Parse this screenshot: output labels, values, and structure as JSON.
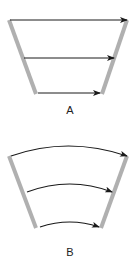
{
  "colors": {
    "wall": "#b0b0b0",
    "arrow": "#1a1a1a",
    "background": "#ffffff"
  },
  "diagrams": [
    {
      "id": "A",
      "label": "A",
      "arrow_type": "straight",
      "arrow_count": 3
    },
    {
      "id": "B",
      "label": "B",
      "arrow_type": "curved",
      "arrow_count": 3
    }
  ]
}
